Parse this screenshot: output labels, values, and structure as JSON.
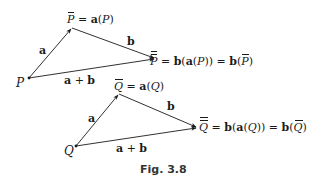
{
  "figure": {
    "caption": "Fig. 3.8",
    "colors": {
      "ink": "#1a1a1a",
      "caption": "#333333",
      "background": "#ffffff"
    },
    "top_triangle": {
      "start_point": "P",
      "mid_point": {
        "symbol": "P",
        "bars": 1,
        "equation": " = a(P)"
      },
      "end_point": {
        "symbol": "P",
        "bars": 2,
        "equation_parts": [
          " = ",
          "b",
          "(",
          "a",
          "(",
          "P",
          ")) = ",
          "b",
          "(",
          "P",
          ")"
        ]
      },
      "edges": {
        "first": "a",
        "second": "b",
        "sum": "a + b"
      }
    },
    "bottom_triangle": {
      "start_point": "Q",
      "mid_point": {
        "symbol": "Q",
        "bars": 1,
        "equation": " = a(Q)"
      },
      "end_point": {
        "symbol": "Q",
        "bars": 2
      },
      "edges": {
        "first": "a",
        "second": "b",
        "sum": "a + b"
      }
    },
    "labels": {
      "P": "P",
      "P_bar": "P",
      "P_dbar": "P",
      "Q": "Q",
      "Q_bar": "Q",
      "Q_dbar": "Q",
      "eq_a": "a",
      "eq_b": "b",
      "eq_equals": " = ",
      "open": "(",
      "close": ")",
      "close2": "))",
      "a_label": "a",
      "b_label": "b",
      "sum_a": "a",
      "sum_plus": " + ",
      "sum_b": "b"
    }
  }
}
